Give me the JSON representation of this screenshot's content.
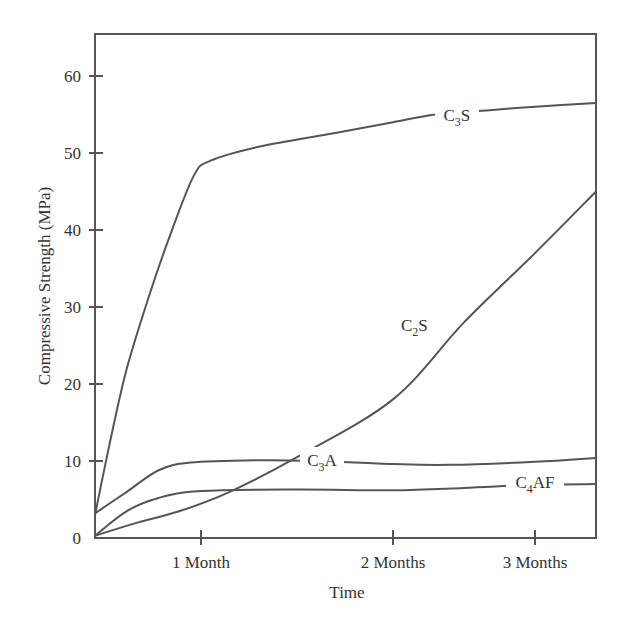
{
  "chart_data": {
    "type": "line",
    "title": "",
    "xlabel": "Time",
    "ylabel": "Compressive Strength (MPa)",
    "ylim": [
      0,
      65
    ],
    "yticks": [
      0,
      10,
      20,
      30,
      40,
      50,
      60
    ],
    "xticks": [
      {
        "value": 1,
        "label": "1 Month"
      },
      {
        "value": 2,
        "label": "2 Months"
      },
      {
        "value": 3,
        "label": "3 Months"
      }
    ],
    "xlim": [
      0,
      3.4
    ],
    "grid": false,
    "series": [
      {
        "name": "C3S",
        "label_main": "C",
        "label_sub": "3",
        "label_tail": "S",
        "label_at": [
          2.45,
          54.8
        ],
        "points": [
          [
            0,
            3
          ],
          [
            0.15,
            13
          ],
          [
            0.3,
            22
          ],
          [
            0.5,
            31
          ],
          [
            0.7,
            39
          ],
          [
            0.93,
            47
          ],
          [
            1.05,
            49
          ],
          [
            1.3,
            50.8
          ],
          [
            1.7,
            52.6
          ],
          [
            2.0,
            54
          ],
          [
            2.3,
            55
          ],
          [
            2.7,
            55.6
          ],
          [
            3.0,
            56
          ],
          [
            3.4,
            56.5
          ]
        ]
      },
      {
        "name": "C2S",
        "label_main": "C",
        "label_sub": "2",
        "label_tail": "S",
        "label_at": [
          2.15,
          27.5
        ],
        "points": [
          [
            0,
            0.3
          ],
          [
            0.4,
            2
          ],
          [
            0.8,
            3.5
          ],
          [
            1.15,
            6
          ],
          [
            1.5,
            10.5
          ],
          [
            2.0,
            18
          ],
          [
            2.5,
            28
          ],
          [
            3.0,
            37
          ],
          [
            3.4,
            45
          ]
        ]
      },
      {
        "name": "C3A",
        "label_main": "C",
        "label_sub": "3",
        "label_tail": "A",
        "label_at": [
          1.63,
          10
        ],
        "points": [
          [
            0,
            3.2
          ],
          [
            0.3,
            6
          ],
          [
            0.6,
            8.8
          ],
          [
            0.9,
            9.8
          ],
          [
            1.3,
            10.1
          ],
          [
            1.6,
            10
          ],
          [
            2.0,
            9.6
          ],
          [
            2.4,
            9.5
          ],
          [
            3.0,
            9.9
          ],
          [
            3.4,
            10.4
          ]
        ]
      },
      {
        "name": "C4AF",
        "label_main": "C",
        "label_sub": "4",
        "label_tail": "AF",
        "label_at": [
          3.0,
          7.2
        ],
        "points": [
          [
            0,
            0.3
          ],
          [
            0.3,
            3.5
          ],
          [
            0.6,
            5.2
          ],
          [
            1.0,
            6.1
          ],
          [
            1.5,
            6.3
          ],
          [
            2.0,
            6.2
          ],
          [
            2.5,
            6.5
          ],
          [
            3.0,
            6.9
          ],
          [
            3.4,
            7
          ]
        ]
      }
    ]
  }
}
